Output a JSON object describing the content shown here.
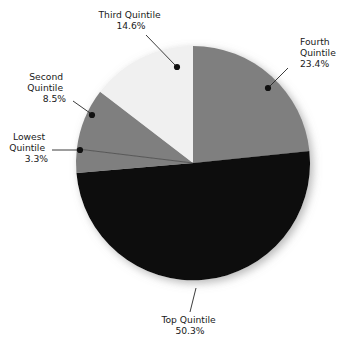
{
  "chart_data": {
    "type": "pie",
    "title": "",
    "subtitle": "",
    "xlabel": "",
    "ylabel": "",
    "legend_position": "none",
    "grid": false,
    "start_angle_deg": 0,
    "direction": "clockwise",
    "units": "percent",
    "categories": [
      "Fourth Quintile",
      "Top Quintile",
      "Lowest Quintile",
      "Second Quintile",
      "Third Quintile"
    ],
    "values": [
      23.4,
      50.3,
      3.3,
      8.5,
      14.6
    ],
    "slices": [
      {
        "name": "fourth-quintile",
        "label_line1": "Fourth",
        "label_line2": "Quintile",
        "value_text": "23.4%",
        "value": 23.4,
        "color": "#7f7f7f",
        "label_align": "left"
      },
      {
        "name": "top-quintile",
        "label_line1": "Top Quintile",
        "label_line2": "",
        "value_text": "50.3%",
        "value": 50.3,
        "color": "#0d0d0d",
        "label_align": "middle"
      },
      {
        "name": "lowest-quintile",
        "label_line1": "Lowest",
        "label_line2": "Quintile",
        "value_text": "3.3%",
        "value": 3.3,
        "color": "#7f7f7f",
        "label_align": "right"
      },
      {
        "name": "second-quintile",
        "label_line1": "Second",
        "label_line2": "Quintile",
        "value_text": "8.5%",
        "value": 8.5,
        "color": "#7f7f7f",
        "label_align": "right"
      },
      {
        "name": "third-quintile",
        "label_line1": "Third Quintile",
        "label_line2": "",
        "value_text": "14.6%",
        "value": 14.6,
        "color": "#f0f0f0",
        "label_align": "middle"
      }
    ],
    "colors": {
      "slice_gray": "#7f7f7f",
      "slice_light": "#f0f0f0",
      "slice_black": "#0d0d0d",
      "leader": "#262626",
      "text": "#1a1a1a",
      "background": "#ffffff"
    }
  },
  "labels": {
    "fourth": {
      "line1": "Fourth",
      "line2": "Quintile",
      "value": "23.4%"
    },
    "top": {
      "line1": "Top Quintile",
      "value": "50.3%"
    },
    "lowest": {
      "line1": "Lowest",
      "line2": "Quintile",
      "value": "3.3%"
    },
    "second": {
      "line1": "Second",
      "line2": "Quintile",
      "value": "8.5%"
    },
    "third": {
      "line1": "Third Quintile",
      "value": "14.6%"
    }
  }
}
